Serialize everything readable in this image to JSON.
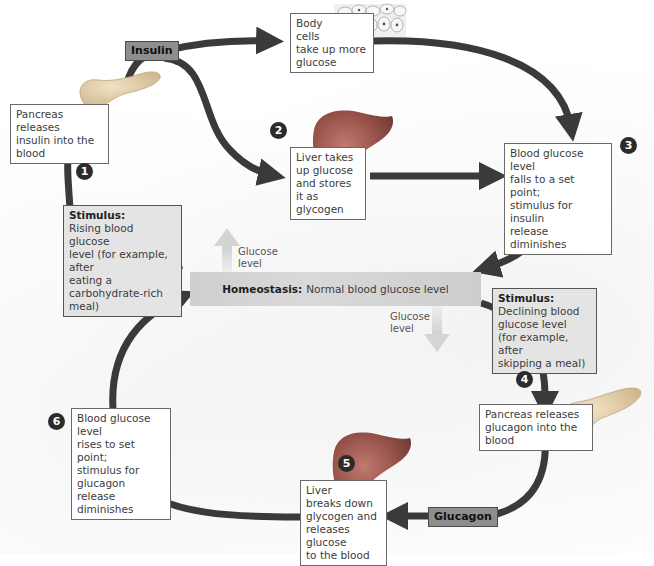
{
  "diagram": {
    "homeostasis": {
      "label": "Homeostasis:",
      "text": "Normal blood glucose level"
    },
    "glucose_up_label": [
      "Glucose",
      "level"
    ],
    "glucose_down_label": [
      "Glucose",
      "level"
    ],
    "hormones": {
      "insulin": "Insulin",
      "glucagon": "Glucagon"
    },
    "steps": [
      "1",
      "2",
      "3",
      "4",
      "5",
      "6"
    ],
    "boxes": {
      "pancreas_insulin": [
        "Pancreas releases",
        "insulin into the blood"
      ],
      "body_cells": [
        "Body",
        "cells",
        "take up more",
        "glucose"
      ],
      "liver_stores": [
        "Liver takes",
        "up glucose",
        "and stores it as",
        "glycogen"
      ],
      "falls_set_point": [
        "Blood glucose level",
        "falls to a set point;",
        "stimulus for insulin",
        "release diminishes"
      ],
      "stimulus_rising": {
        "label": "Stimulus:",
        "lines": [
          "Rising blood glucose",
          "level (for example, after",
          "eating a carbohydrate-rich",
          "meal)"
        ]
      },
      "stimulus_declining": {
        "label": "Stimulus:",
        "lines": [
          "Declining blood",
          "glucose level",
          "(for example, after",
          "skipping a meal)"
        ]
      },
      "pancreas_glucagon": [
        "Pancreas releases",
        "glucagon into the blood"
      ],
      "liver_breaks": [
        "Liver",
        "breaks down",
        "glycogen and",
        "releases glucose",
        "to the blood"
      ],
      "rises_set_point": [
        "Blood glucose level",
        "rises to set point;",
        "stimulus for glucagon",
        "release diminishes"
      ]
    },
    "colors": {
      "arrow": "#3a3a3a",
      "hormone_fill": "#8e8e8e",
      "stimulus_fill": "#e4e4e4",
      "homeostasis_fill": "#d2d2d2",
      "organ_pancreas": "#d9c4a0",
      "organ_liver": "#9a5a52",
      "glucose_arrow": "#d6d6d6"
    }
  }
}
